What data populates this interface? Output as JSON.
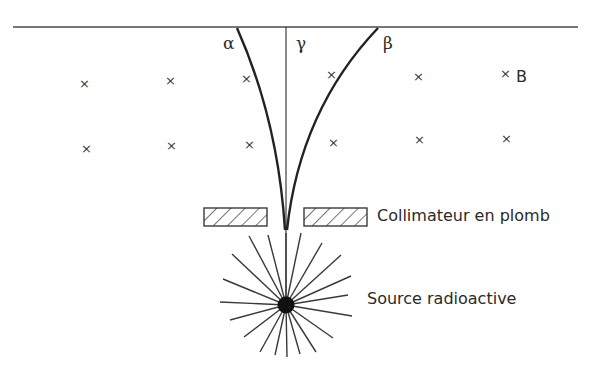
{
  "diagram": {
    "labels": {
      "alpha": "α",
      "gamma": "γ",
      "beta": "β",
      "field": "B",
      "collimator": "Collimateur en plomb",
      "source": "Source radioactive"
    },
    "field_marker": "×",
    "field_markers": [
      {
        "x": 84,
        "y": 85
      },
      {
        "x": 170,
        "y": 82
      },
      {
        "x": 246,
        "y": 80
      },
      {
        "x": 331,
        "y": 76
      },
      {
        "x": 418,
        "y": 78
      },
      {
        "x": 505,
        "y": 75
      },
      {
        "x": 86,
        "y": 150
      },
      {
        "x": 171,
        "y": 147
      },
      {
        "x": 249,
        "y": 146
      },
      {
        "x": 333,
        "y": 144
      },
      {
        "x": 419,
        "y": 141
      },
      {
        "x": 506,
        "y": 140
      }
    ],
    "colors": {
      "line": "#2b2b2b",
      "text": "#2a2a2a",
      "background": "#ffffff"
    }
  }
}
